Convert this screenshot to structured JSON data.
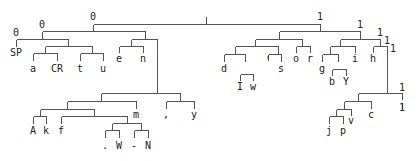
{
  "diagram": {
    "type": "binary-code-tree",
    "colors": {
      "edge": "#555555",
      "text": "#222222",
      "background": "#ffffff"
    },
    "edges": [
      [
        206,
        16,
        206,
        24
      ],
      [
        93,
        24,
        320,
        24
      ],
      [
        93,
        24,
        93,
        31
      ],
      [
        42,
        31,
        145,
        31
      ],
      [
        42,
        31,
        42,
        39
      ],
      [
        16,
        39,
        68,
        39
      ],
      [
        16,
        39,
        16,
        46
      ],
      [
        68,
        39,
        68,
        46
      ],
      [
        45,
        46,
        92,
        46
      ],
      [
        45,
        46,
        45,
        53
      ],
      [
        33,
        53,
        57,
        53
      ],
      [
        33,
        53,
        33,
        60
      ],
      [
        57,
        53,
        57,
        60
      ],
      [
        92,
        46,
        92,
        53
      ],
      [
        80,
        53,
        103,
        53
      ],
      [
        80,
        53,
        80,
        60
      ],
      [
        103,
        53,
        103,
        60
      ],
      [
        145,
        31,
        145,
        39
      ],
      [
        131,
        39,
        157,
        39
      ],
      [
        131,
        39,
        131,
        46
      ],
      [
        119,
        46,
        143,
        46
      ],
      [
        119,
        46,
        119,
        52
      ],
      [
        143,
        46,
        143,
        52
      ],
      [
        157,
        39,
        157,
        93
      ],
      [
        101,
        93,
        180,
        93
      ],
      [
        101,
        93,
        101,
        101
      ],
      [
        67,
        101,
        136,
        101
      ],
      [
        67,
        101,
        67,
        109
      ],
      [
        40,
        109,
        94,
        109
      ],
      [
        40,
        109,
        40,
        116
      ],
      [
        33,
        116,
        46,
        116
      ],
      [
        33,
        116,
        33,
        123
      ],
      [
        46,
        116,
        46,
        123
      ],
      [
        94,
        109,
        94,
        116
      ],
      [
        61,
        116,
        127,
        116
      ],
      [
        61,
        116,
        61,
        123
      ],
      [
        127,
        116,
        127,
        123
      ],
      [
        112,
        123,
        141,
        123
      ],
      [
        112,
        123,
        112,
        130
      ],
      [
        105,
        130,
        119,
        130
      ],
      [
        105,
        130,
        105,
        137
      ],
      [
        119,
        130,
        119,
        137
      ],
      [
        141,
        123,
        141,
        130
      ],
      [
        134,
        130,
        148,
        130
      ],
      [
        134,
        130,
        134,
        137
      ],
      [
        148,
        130,
        148,
        137
      ],
      [
        136,
        101,
        136,
        108
      ],
      [
        180,
        93,
        180,
        101
      ],
      [
        166,
        101,
        194,
        101
      ],
      [
        166,
        101,
        166,
        108
      ],
      [
        194,
        101,
        194,
        108
      ],
      [
        320,
        24,
        320,
        31
      ],
      [
        279,
        31,
        360,
        31
      ],
      [
        279,
        31,
        279,
        39
      ],
      [
        255,
        39,
        302,
        39
      ],
      [
        255,
        39,
        255,
        46
      ],
      [
        235,
        46,
        278,
        46
      ],
      [
        235,
        46,
        235,
        54
      ],
      [
        224,
        54,
        245,
        54
      ],
      [
        224,
        54,
        224,
        61
      ],
      [
        245,
        54,
        245,
        61
      ],
      [
        240,
        74,
        253,
        74
      ],
      [
        240,
        74,
        240,
        80
      ],
      [
        253,
        74,
        253,
        80
      ],
      [
        278,
        46,
        278,
        54
      ],
      [
        268,
        54,
        281,
        54
      ],
      [
        268,
        54,
        268,
        60
      ],
      [
        281,
        54,
        281,
        61
      ],
      [
        302,
        39,
        302,
        46
      ],
      [
        296,
        46,
        310,
        46
      ],
      [
        296,
        46,
        296,
        52
      ],
      [
        310,
        46,
        310,
        52
      ],
      [
        360,
        31,
        360,
        39
      ],
      [
        340,
        39,
        380,
        39
      ],
      [
        340,
        39,
        340,
        46
      ],
      [
        330,
        46,
        355,
        46
      ],
      [
        330,
        46,
        330,
        54
      ],
      [
        322,
        54,
        338,
        54
      ],
      [
        322,
        54,
        322,
        61
      ],
      [
        338,
        54,
        338,
        61
      ],
      [
        332,
        69,
        346,
        69
      ],
      [
        332,
        69,
        332,
        75
      ],
      [
        346,
        69,
        346,
        75
      ],
      [
        355,
        46,
        355,
        52
      ],
      [
        380,
        39,
        380,
        46
      ],
      [
        373,
        46,
        387,
        46
      ],
      [
        373,
        46,
        373,
        52
      ],
      [
        387,
        46,
        387,
        93
      ],
      [
        358,
        93,
        402,
        93
      ],
      [
        358,
        93,
        358,
        101
      ],
      [
        344,
        101,
        371,
        101
      ],
      [
        344,
        101,
        344,
        109
      ],
      [
        336,
        109,
        351,
        109
      ],
      [
        336,
        109,
        336,
        116
      ],
      [
        329,
        116,
        343,
        116
      ],
      [
        329,
        116,
        329,
        123
      ],
      [
        343,
        116,
        343,
        123
      ],
      [
        351,
        109,
        351,
        115
      ],
      [
        371,
        101,
        371,
        108
      ],
      [
        402,
        93,
        402,
        99
      ],
      [
        402,
        102,
        402,
        108
      ]
    ],
    "bit_labels": [
      {
        "text": "0",
        "x": 93,
        "y": 20
      },
      {
        "text": "1",
        "x": 320,
        "y": 20
      },
      {
        "text": "0",
        "x": 42,
        "y": 28
      },
      {
        "text": "0",
        "x": 16,
        "y": 36
      },
      {
        "text": "1",
        "x": 360,
        "y": 28
      },
      {
        "text": "1",
        "x": 380,
        "y": 36
      },
      {
        "text": "1",
        "x": 387,
        "y": 44
      },
      {
        "text": "1",
        "x": 393,
        "y": 52
      },
      {
        "text": "1",
        "x": 402,
        "y": 91
      },
      {
        "text": "1",
        "x": 402,
        "y": 111
      }
    ],
    "leaves": [
      {
        "text": "SP",
        "x": 16,
        "y": 56
      },
      {
        "text": "a",
        "x": 33,
        "y": 72
      },
      {
        "text": "CR",
        "x": 57,
        "y": 72
      },
      {
        "text": "t",
        "x": 80,
        "y": 72
      },
      {
        "text": "u",
        "x": 103,
        "y": 72
      },
      {
        "text": "e",
        "x": 119,
        "y": 62
      },
      {
        "text": "n",
        "x": 143,
        "y": 62
      },
      {
        "text": "A",
        "x": 33,
        "y": 134
      },
      {
        "text": "k",
        "x": 46,
        "y": 134
      },
      {
        "text": "f",
        "x": 61,
        "y": 134
      },
      {
        "text": "m",
        "x": 136,
        "y": 118
      },
      {
        "text": ".",
        "x": 105,
        "y": 149
      },
      {
        "text": "W",
        "x": 119,
        "y": 149
      },
      {
        "text": "-",
        "x": 134,
        "y": 149
      },
      {
        "text": "N",
        "x": 148,
        "y": 149
      },
      {
        "text": ",",
        "x": 166,
        "y": 118
      },
      {
        "text": "y",
        "x": 194,
        "y": 118
      },
      {
        "text": "d",
        "x": 224,
        "y": 72
      },
      {
        "text": "I",
        "x": 240,
        "y": 90
      },
      {
        "text": "w",
        "x": 253,
        "y": 90
      },
      {
        "text": "'",
        "x": 268,
        "y": 64
      },
      {
        "text": "s",
        "x": 281,
        "y": 72
      },
      {
        "text": "o",
        "x": 296,
        "y": 62
      },
      {
        "text": "r",
        "x": 310,
        "y": 62
      },
      {
        "text": "g",
        "x": 322,
        "y": 72
      },
      {
        "text": "b",
        "x": 332,
        "y": 85
      },
      {
        "text": "Y",
        "x": 346,
        "y": 85
      },
      {
        "text": "i",
        "x": 355,
        "y": 62
      },
      {
        "text": "h",
        "x": 373,
        "y": 62
      },
      {
        "text": "j",
        "x": 329,
        "y": 134
      },
      {
        "text": "p",
        "x": 343,
        "y": 134
      },
      {
        "text": "v",
        "x": 351,
        "y": 124
      },
      {
        "text": "c",
        "x": 371,
        "y": 118
      }
    ]
  }
}
